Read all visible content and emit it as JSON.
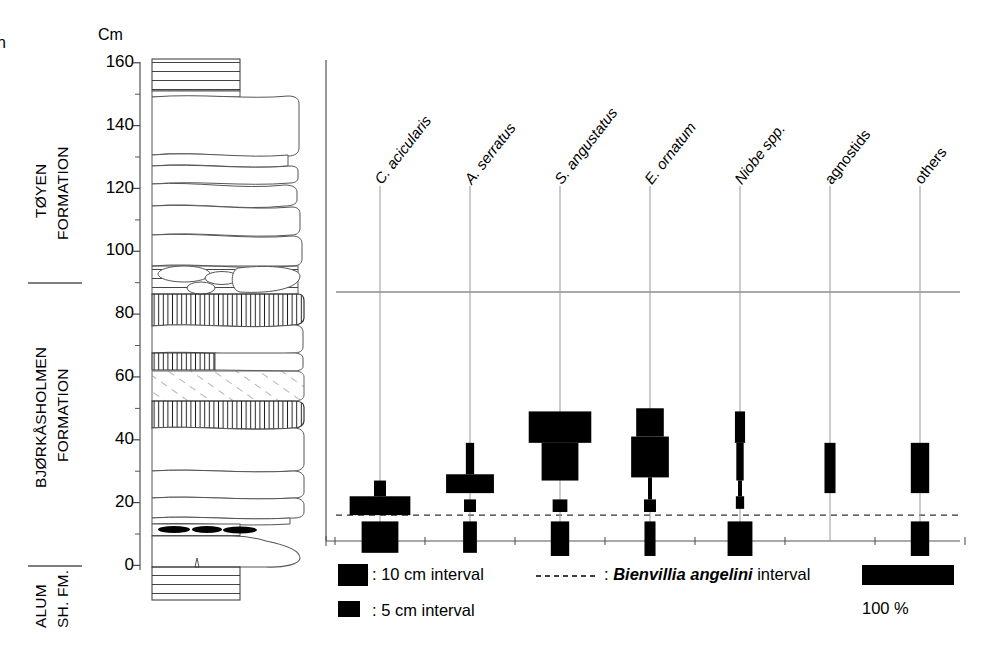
{
  "figure": {
    "unit_caption": "Cm",
    "stray_mark": "n"
  },
  "formations": [
    {
      "name": "toyen",
      "line1": "TØYEN",
      "line2": "FORMATION",
      "top_cm": 160,
      "base_cm": 87
    },
    {
      "name": "bjorkasholmen",
      "line1": "BJØRKÅSHOLMEN",
      "line2": "FORMATION",
      "top_cm": 87,
      "base_cm": 0
    },
    {
      "name": "alum-shale",
      "line1": "ALUM",
      "line2": "SH. FM.",
      "top_cm": 0,
      "base_cm": -8
    }
  ],
  "axis": {
    "ticks_major": [
      0,
      20,
      40,
      60,
      80,
      100,
      120,
      140,
      160
    ],
    "ticks_minor": [
      10,
      30,
      50,
      70,
      90,
      110,
      130,
      150
    ],
    "min_cm": -8,
    "max_cm": 162
  },
  "chart_data": {
    "type": "bar",
    "title": "",
    "xlabel": "",
    "ylabel": "Cm",
    "ylim": [
      -8,
      162
    ],
    "orientation": "horizontal-stacked-by-level",
    "scale_note": "bar width = relative abundance, 100 % = 92 px",
    "categories": [
      "C. acicularis",
      "A. serratus",
      "S. angustatus",
      "E. ornatum",
      "Niobe spp.",
      "agnostids",
      "others"
    ],
    "categories_italic": [
      true,
      true,
      true,
      true,
      true,
      false,
      false
    ],
    "series": [
      {
        "name": "C. acicularis",
        "bars": [
          {
            "top_cm": 27,
            "bottom_cm": 22,
            "pct": 13,
            "interval": "5 cm"
          },
          {
            "top_cm": 22,
            "bottom_cm": 16,
            "pct": 66,
            "interval": "5 cm"
          },
          {
            "top_cm": 14,
            "bottom_cm": 4,
            "pct": 40,
            "interval": "10 cm"
          }
        ]
      },
      {
        "name": "A. serratus",
        "bars": [
          {
            "top_cm": 39,
            "bottom_cm": 29,
            "pct": 9,
            "interval": "10 cm"
          },
          {
            "top_cm": 29,
            "bottom_cm": 23,
            "pct": 52,
            "interval": "5 cm"
          },
          {
            "top_cm": 21,
            "bottom_cm": 17,
            "pct": 13,
            "interval": "5 cm"
          },
          {
            "top_cm": 14,
            "bottom_cm": 4,
            "pct": 15,
            "interval": "10 cm"
          }
        ]
      },
      {
        "name": "S. angustatus",
        "bars": [
          {
            "top_cm": 49,
            "bottom_cm": 39,
            "pct": 68,
            "interval": "10 cm"
          },
          {
            "top_cm": 39,
            "bottom_cm": 27,
            "pct": 40,
            "interval": "10 cm"
          },
          {
            "top_cm": 21,
            "bottom_cm": 17,
            "pct": 16,
            "interval": "5 cm"
          },
          {
            "top_cm": 14,
            "bottom_cm": 3,
            "pct": 20,
            "interval": "10 cm"
          }
        ]
      },
      {
        "name": "E. ornatum",
        "bars": [
          {
            "top_cm": 50,
            "bottom_cm": 41,
            "pct": 30,
            "interval": "10 cm"
          },
          {
            "top_cm": 41,
            "bottom_cm": 28,
            "pct": 41,
            "interval": "10 cm"
          },
          {
            "top_cm": 28,
            "bottom_cm": 21,
            "pct": 4,
            "interval": "5 cm"
          },
          {
            "top_cm": 21,
            "bottom_cm": 17,
            "pct": 13,
            "interval": "5 cm"
          },
          {
            "top_cm": 14,
            "bottom_cm": 3,
            "pct": 12,
            "interval": "10 cm"
          }
        ]
      },
      {
        "name": "Niobe spp.",
        "bars": [
          {
            "top_cm": 49,
            "bottom_cm": 39,
            "pct": 11,
            "interval": "10 cm"
          },
          {
            "top_cm": 39,
            "bottom_cm": 27,
            "pct": 8,
            "interval": "10 cm"
          },
          {
            "top_cm": 27,
            "bottom_cm": 22,
            "pct": 3,
            "interval": "5 cm"
          },
          {
            "top_cm": 22,
            "bottom_cm": 18,
            "pct": 9,
            "interval": "5 cm"
          },
          {
            "top_cm": 14,
            "bottom_cm": 3,
            "pct": 27,
            "interval": "10 cm"
          }
        ]
      },
      {
        "name": "agnostids",
        "bars": [
          {
            "top_cm": 39,
            "bottom_cm": 23,
            "pct": 12,
            "interval": "10 cm"
          }
        ]
      },
      {
        "name": "others",
        "bars": [
          {
            "top_cm": 39,
            "bottom_cm": 23,
            "pct": 20,
            "interval": "10 cm"
          },
          {
            "top_cm": 14,
            "bottom_cm": 3,
            "pct": 20,
            "interval": "10 cm"
          }
        ]
      }
    ],
    "marker_lines": [
      {
        "name": "formation-boundary",
        "cm": 87,
        "style": "solid"
      },
      {
        "name": "bienvillia-angelini-interval",
        "cm": 16,
        "style": "dashed"
      }
    ]
  },
  "legend": {
    "item_10cm": ": 10 cm interval",
    "item_5cm": ": 5 cm interval",
    "interval_prefix": ": ",
    "interval_taxon": "Bienvillia angelini",
    "interval_suffix": " interval",
    "scale_label": "100 %"
  },
  "lithology": {
    "shale_top": {
      "from_cm": 152,
      "to_cm": 161,
      "pattern": "horizontal-lines"
    },
    "shale_bottom": {
      "from_cm": -8,
      "to_cm": 0,
      "pattern": "horizontal-lines"
    },
    "bioturbated_beds": [
      {
        "from_cm": 75,
        "to_cm": 86,
        "pattern": "vertical-lines"
      },
      {
        "from_cm": 68,
        "to_cm": 72,
        "pattern": "vertical-lines"
      },
      {
        "from_cm": 56,
        "to_cm": 62,
        "pattern": "vertical-lines"
      }
    ],
    "hatched_bed": {
      "from_cm": 62,
      "to_cm": 68,
      "pattern": "diagonal-hatch"
    },
    "nodular_bed": {
      "from_cm": 88,
      "to_cm": 97,
      "pattern": "nodules"
    },
    "black_lenses_cm": 15
  }
}
